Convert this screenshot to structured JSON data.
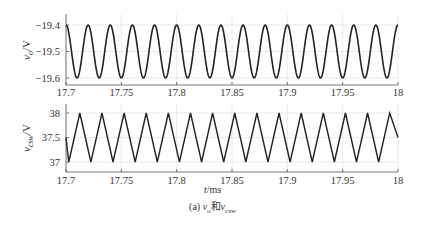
{
  "chart_data": [
    {
      "type": "line",
      "title": "",
      "xlabel": "",
      "ylabel": "v_o/V",
      "xlim": [
        17.7,
        18
      ],
      "ylim": [
        -19.62,
        -19.38
      ],
      "x_ticks": [
        "17.7",
        "17.75",
        "17.8",
        "17.85",
        "17.9",
        "17.95",
        "18"
      ],
      "y_ticks": [
        "-19.4",
        "-19.5",
        "-19.6"
      ],
      "grid": true,
      "series": [
        {
          "name": "v_o",
          "waveform": "sine",
          "mean": -19.5,
          "amplitude": 0.1,
          "period_ms": 0.02,
          "cycles": 15,
          "start_value": -19.4,
          "end_value": -19.4,
          "color": "#222222"
        }
      ]
    },
    {
      "type": "line",
      "title": "",
      "xlabel": "t/ms",
      "ylabel": "v_csw/V",
      "xlim": [
        17.7,
        18
      ],
      "ylim": [
        36.88,
        38.12
      ],
      "x_ticks": [
        "17.7",
        "17.75",
        "17.8",
        "17.85",
        "17.9",
        "17.95",
        "18"
      ],
      "y_ticks": [
        "38",
        "37.5",
        "37"
      ],
      "grid": true,
      "series": [
        {
          "name": "v_csw",
          "waveform": "triangle",
          "min": 37.0,
          "max": 38.0,
          "period_ms": 0.02,
          "cycles": 15,
          "start_value": 37.5,
          "end_value": 37.5,
          "color": "#222222"
        }
      ]
    }
  ],
  "top_plot": {
    "ylabel_main": "v",
    "ylabel_sub": "o",
    "ylabel_unit": "/V",
    "y_ticks": [
      "−19.4",
      "−19.5",
      "−19.6"
    ],
    "x_ticks": [
      "17.7",
      "17.75",
      "17.8",
      "17.85",
      "17.9",
      "17.95",
      "18"
    ]
  },
  "bottom_plot": {
    "ylabel_main": "v",
    "ylabel_sub": "csw",
    "ylabel_unit": "/V",
    "y_ticks": [
      "38",
      "37.5",
      "37"
    ],
    "x_ticks": [
      "17.7",
      "17.75",
      "17.8",
      "17.85",
      "17.9",
      "17.95",
      "18"
    ]
  },
  "xlabel": "t/ms",
  "caption": "(a) vₒ和vₜₛᵤ"
}
